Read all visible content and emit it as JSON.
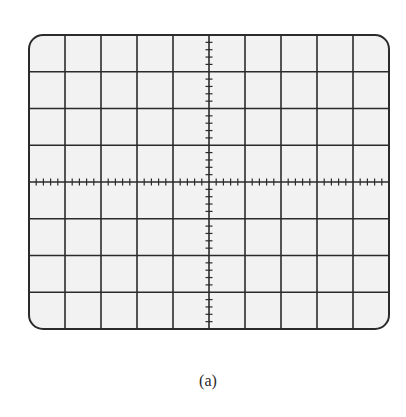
{
  "figure": {
    "caption": "(a)",
    "type": "oscilloscope-graticule",
    "grid": {
      "horizontal_divisions": 10,
      "vertical_divisions": 8,
      "minor_ticks_per_division": 5,
      "left": 29,
      "top": 35,
      "right": 389,
      "bottom": 329,
      "corner_radius": 14
    },
    "colors": {
      "screen_fill": "#f2f2f2",
      "grid_line": "#2b2b2b",
      "border": "#2b2b2b",
      "caption": "#2a2a2a"
    }
  }
}
